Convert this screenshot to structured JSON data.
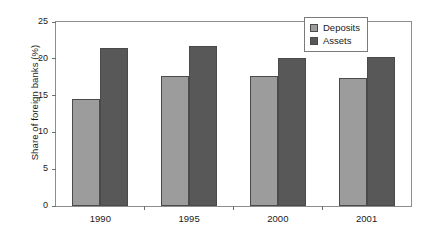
{
  "chart_data": {
    "type": "bar",
    "title": "",
    "xlabel": "",
    "ylabel": "Share of foreign banks (%)",
    "categories": [
      "1990",
      "1995",
      "2000",
      "2001"
    ],
    "series": [
      {
        "name": "Deposits",
        "color": "#9c9c9c",
        "values": [
          14.5,
          17.6,
          17.7,
          17.4
        ]
      },
      {
        "name": "Assets",
        "color": "#585858",
        "values": [
          21.5,
          21.8,
          20.1,
          20.2
        ]
      }
    ],
    "ylim": [
      0,
      25
    ],
    "yticks": [
      0,
      5,
      10,
      15,
      20,
      25
    ],
    "yticklabels": [
      "0",
      "5",
      "10",
      "15",
      "20",
      "25"
    ],
    "grid": false,
    "legend_position": "top-right",
    "legend_entries": [
      "Deposits",
      "Assets"
    ]
  }
}
